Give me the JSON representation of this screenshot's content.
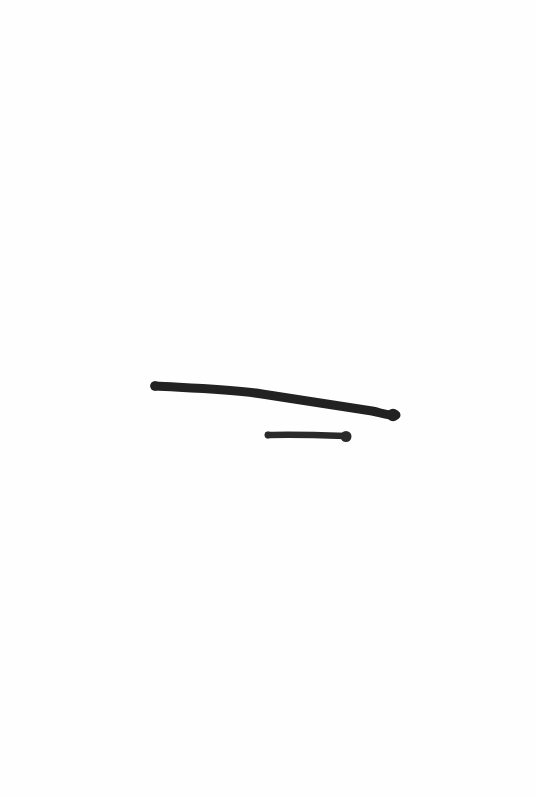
{
  "canvas": {
    "width": 536,
    "height": 798,
    "background": "#fefefe"
  },
  "strokes": [
    {
      "label": "long-stroke",
      "color": "#222222",
      "width": 9,
      "path": "M 155 386 C 190 388, 230 389, 262 394 C 300 400, 340 406, 372 411 C 382 413, 388 416, 396 415",
      "end_cap": {
        "cx": 393,
        "cy": 415,
        "r": 6.2
      },
      "start_cap": {
        "cx": 155,
        "cy": 386,
        "r": 4.8
      }
    },
    {
      "label": "short-stroke",
      "color": "#2a2a2a",
      "width": 6.5,
      "path": "M 268 435 C 290 434, 320 435, 346 436",
      "end_cap": {
        "cx": 346,
        "cy": 436.5,
        "r": 5.5
      },
      "start_cap": {
        "cx": 268,
        "cy": 435,
        "r": 3.4
      }
    }
  ]
}
